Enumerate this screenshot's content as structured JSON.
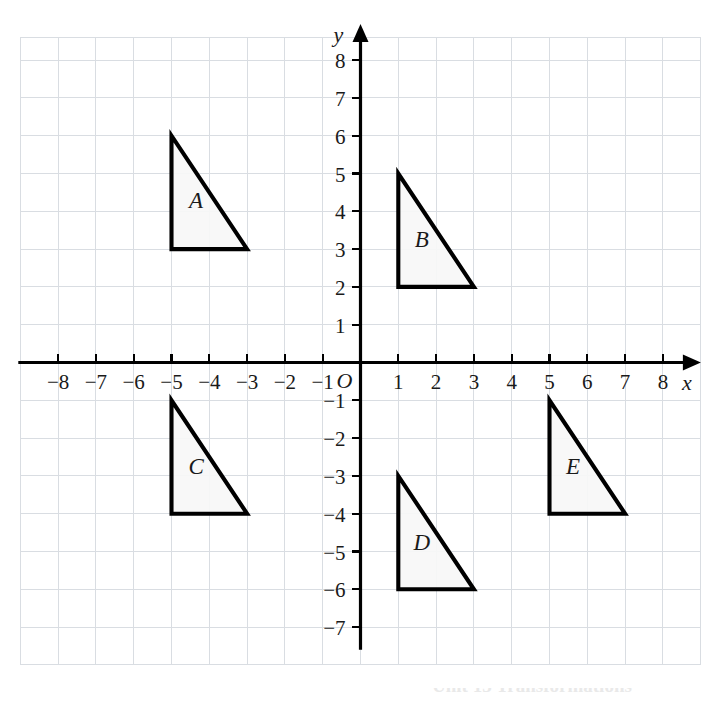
{
  "figure": {
    "kind": "cartesian-coordinate-plane",
    "background_color": "#ffffff",
    "grid_color": "#d9dde2",
    "axis_color": "#000000",
    "shape_fill_color": "#f7f7f7",
    "shape_stroke_color": "#000000"
  },
  "axes": {
    "x_axis_name": "x",
    "y_axis_name": "y",
    "origin_label": "O",
    "x_tick_labels": [
      "−8",
      "−7",
      "−6",
      "−5",
      "−4",
      "−3",
      "−2",
      "−1",
      "1",
      "2",
      "3",
      "4",
      "5",
      "6",
      "7",
      "8"
    ],
    "x_tick_values": [
      -8,
      -7,
      -6,
      -5,
      -4,
      -3,
      -2,
      -1,
      1,
      2,
      3,
      4,
      5,
      6,
      7,
      8
    ],
    "y_tick_labels": [
      "8",
      "7",
      "6",
      "5",
      "4",
      "3",
      "2",
      "1",
      "−1",
      "−2",
      "−3",
      "−4",
      "−5",
      "−6",
      "−7"
    ],
    "y_tick_values": [
      8,
      7,
      6,
      5,
      4,
      3,
      2,
      1,
      -1,
      -2,
      -3,
      -4,
      -5,
      -6,
      -7
    ]
  },
  "caption": {
    "text": "Unit 13 Transformations"
  },
  "chart_data": {
    "type": "scatter",
    "title": "",
    "xlabel": "x",
    "ylabel": "y",
    "xlim": [
      -9,
      9
    ],
    "ylim": [
      -8,
      8.5
    ],
    "grid": true,
    "legend": "none",
    "xticks": [
      -8,
      -7,
      -6,
      -5,
      -4,
      -3,
      -2,
      -1,
      1,
      2,
      3,
      4,
      5,
      6,
      7,
      8
    ],
    "yticks": [
      8,
      7,
      6,
      5,
      4,
      3,
      2,
      1,
      -1,
      -2,
      -3,
      -4,
      -5,
      -6,
      -7
    ],
    "annotations": [
      "A",
      "B",
      "C",
      "D",
      "E"
    ],
    "shapes": [
      {
        "label": "A",
        "shape": "right-triangle",
        "vertices": [
          [
            -5,
            6
          ],
          [
            -5,
            3
          ],
          [
            -3,
            3
          ]
        ],
        "label_position": [
          -4.35,
          4.1
        ]
      },
      {
        "label": "B",
        "shape": "right-triangle",
        "vertices": [
          [
            1,
            5
          ],
          [
            1,
            2
          ],
          [
            3,
            2
          ]
        ],
        "label_position": [
          1.62,
          3.05
        ]
      },
      {
        "label": "C",
        "shape": "right-triangle",
        "vertices": [
          [
            -5,
            -1
          ],
          [
            -5,
            -4
          ],
          [
            -3,
            -4
          ]
        ],
        "label_position": [
          -4.35,
          -2.95
        ]
      },
      {
        "label": "D",
        "shape": "right-triangle",
        "vertices": [
          [
            1,
            -3
          ],
          [
            1,
            -6
          ],
          [
            3,
            -6
          ]
        ],
        "label_position": [
          1.62,
          -4.95
        ]
      },
      {
        "label": "E",
        "shape": "right-triangle",
        "vertices": [
          [
            5,
            -1
          ],
          [
            5,
            -4
          ],
          [
            7,
            -4
          ]
        ],
        "label_position": [
          5.62,
          -2.95
        ]
      }
    ]
  }
}
